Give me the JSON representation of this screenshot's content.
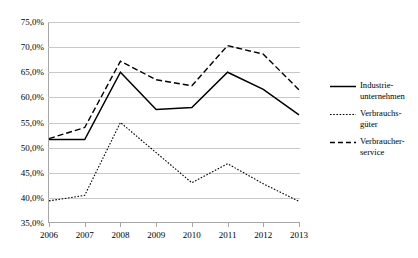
{
  "chart_data": {
    "type": "line",
    "title": "",
    "subtitle": "",
    "xlabel": "",
    "ylabel": "",
    "categories": [
      "2006",
      "2007",
      "2008",
      "2009",
      "2010",
      "2011",
      "2012",
      "2013"
    ],
    "x": [
      2006,
      2007,
      2008,
      2009,
      2010,
      2011,
      2012,
      2013
    ],
    "ylim": [
      35.0,
      75.0
    ],
    "ytick_values": [
      35.0,
      40.0,
      45.0,
      50.0,
      55.0,
      60.0,
      65.0,
      70.0,
      75.0
    ],
    "ytick_labels": [
      "35,0%",
      "40,0%",
      "45,0%",
      "50,0%",
      "55,0%",
      "60,0%",
      "65,0%",
      "70,0%",
      "75,0%"
    ],
    "grid": true,
    "grid_axis": "y",
    "legend_position": "right",
    "units": "percent",
    "decimal_separator": ",",
    "series": [
      {
        "name": "Industrie-\nunternehmen",
        "style": "solid",
        "color": "#000000",
        "values": [
          51.6,
          51.6,
          65.0,
          57.6,
          58.0,
          65.0,
          61.6,
          56.5
        ]
      },
      {
        "name": "Verbrauchs-\ngüter",
        "style": "dotted",
        "color": "#000000",
        "values": [
          39.4,
          40.5,
          55.0,
          49.0,
          43.0,
          46.8,
          42.8,
          39.3
        ]
      },
      {
        "name": "Verbraucher-\nservice",
        "style": "dashed",
        "color": "#000000",
        "values": [
          51.8,
          54.0,
          67.2,
          63.5,
          62.3,
          70.3,
          68.6,
          61.5
        ]
      }
    ]
  },
  "legend": {
    "items": [
      {
        "label": "Industrie-\nunternehmen",
        "style": "solid"
      },
      {
        "label": "Verbrauchs-\ngüter",
        "style": "dotted"
      },
      {
        "label": "Verbraucher-\nservice",
        "style": "dashed"
      }
    ]
  }
}
